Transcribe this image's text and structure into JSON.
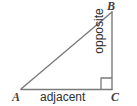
{
  "figure": {
    "type": "right-triangle-trigonometry-diagram",
    "stroke_color": "#7a7a7a",
    "label_color": "#3f3f3f",
    "background_color": "#ffffff",
    "width": 137,
    "height": 106
  },
  "vertices": {
    "a": {
      "label": "A",
      "x": 21,
      "y": 89
    },
    "b": {
      "label": "B",
      "x": 112,
      "y": 12
    },
    "c": {
      "label": "C",
      "x": 112,
      "y": 89
    }
  },
  "sides": {
    "adjacent": {
      "label": "adjacent",
      "from": "A",
      "to": "C"
    },
    "opposite": {
      "label": "opposite",
      "from": "B",
      "to": "C"
    },
    "hypotenuse": {
      "label": "",
      "from": "A",
      "to": "B"
    }
  },
  "markers": {
    "right_angle": {
      "at": "C",
      "size": 11
    }
  }
}
